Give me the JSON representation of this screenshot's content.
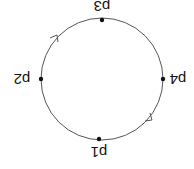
{
  "diagram": {
    "orientation": "rotated 180 degrees",
    "circle": {
      "cx": 102,
      "cy": 79,
      "r": 61,
      "stroke": "#555555"
    },
    "points": [
      {
        "id": "p1",
        "label": "p1",
        "x": 99,
        "y": 139,
        "label_x": 99,
        "label_y": 158
      },
      {
        "id": "p2",
        "label": "p2",
        "x": 41,
        "y": 79,
        "label_x": 22,
        "label_y": 79
      },
      {
        "id": "p3",
        "label": "p3",
        "x": 102,
        "y": 20,
        "label_x": 102,
        "label_y": 6
      },
      {
        "id": "p4",
        "label": "p4",
        "x": 163,
        "y": 79,
        "label_x": 180,
        "label_y": 79
      }
    ],
    "arrows": [
      {
        "id": "arrow-upper-left",
        "x": 55,
        "y": 40
      },
      {
        "id": "arrow-lower-right",
        "x": 150,
        "y": 117
      }
    ]
  }
}
